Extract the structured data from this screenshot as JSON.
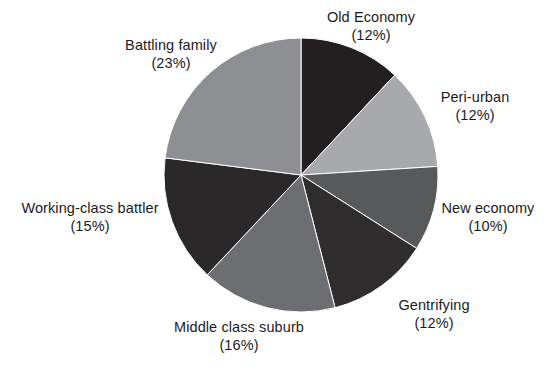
{
  "chart_data": {
    "type": "pie",
    "title": "",
    "subtitle": "",
    "xlabel": "",
    "ylabel": "",
    "legend_position": "none",
    "grid": false,
    "label_format": "name + (value%)",
    "start_angle_deg": 0,
    "direction": "clockwise",
    "center": {
      "x": 301,
      "y": 175
    },
    "radius": 137,
    "categories": [
      "Old Economy",
      "Peri-urban",
      "New economy",
      "Gentrifying",
      "Middle class suburb",
      "Working-class battler",
      "Battling family"
    ],
    "values": [
      12,
      12,
      10,
      12,
      16,
      15,
      23
    ],
    "slices": [
      {
        "name": "Old Economy",
        "value": 12,
        "value_text": "(12%)",
        "color": "#231f20",
        "start_angle_deg": 0,
        "end_angle_deg": 43.2,
        "label_id": "label-old-economy"
      },
      {
        "name": "Peri-urban",
        "value": 12,
        "value_text": "(12%)",
        "color": "#a7a9ac",
        "start_angle_deg": 43.2,
        "end_angle_deg": 86.4,
        "label_id": "label-peri-urban"
      },
      {
        "name": "New economy",
        "value": 10,
        "value_text": "(10%)",
        "color": "#58595b",
        "start_angle_deg": 86.4,
        "end_angle_deg": 122.4,
        "label_id": "label-new-economy"
      },
      {
        "name": "Gentrifying",
        "value": 12,
        "value_text": "(12%)",
        "color": "#302d2e",
        "start_angle_deg": 122.4,
        "end_angle_deg": 165.6,
        "label_id": "label-gentrifying"
      },
      {
        "name": "Middle class suburb",
        "value": 16,
        "value_text": "(16%)",
        "color": "#6d6e71",
        "start_angle_deg": 165.6,
        "end_angle_deg": 223.2,
        "label_id": "label-middle-class"
      },
      {
        "name": "Working-class battler",
        "value": 15,
        "value_text": "(15%)",
        "color": "#2b2829",
        "start_angle_deg": 223.2,
        "end_angle_deg": 277.2,
        "label_id": "label-working-class"
      },
      {
        "name": "Battling family",
        "value": 23,
        "value_text": "(23%)",
        "color": "#8d8f92",
        "start_angle_deg": 277.2,
        "end_angle_deg": 360,
        "label_id": "label-battling-family"
      }
    ],
    "background_color": "#ffffff",
    "text_color": "#1b1b1b"
  },
  "labels": {
    "old_economy": {
      "name": "Old Economy",
      "pct": "(12%)"
    },
    "peri_urban": {
      "name": "Peri-urban",
      "pct": "(12%)"
    },
    "new_economy": {
      "name": "New economy",
      "pct": "(10%)"
    },
    "gentrifying": {
      "name": "Gentrifying",
      "pct": "(12%)"
    },
    "middle_class_suburb": {
      "name": "Middle class suburb",
      "pct": "(16%)"
    },
    "working_class_battler": {
      "name": "Working-class battler",
      "pct": "(15%)"
    },
    "battling_family": {
      "name": "Battling family",
      "pct": "(23%)"
    }
  }
}
